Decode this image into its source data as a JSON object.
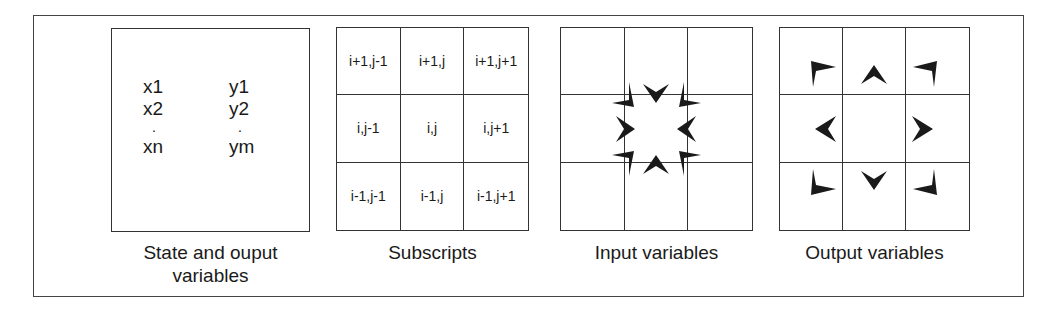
{
  "panels": {
    "state": {
      "caption_line1": "State and ouput",
      "caption_line2": "variables",
      "x_vars": [
        "x1",
        "x2",
        ".",
        "xn"
      ],
      "y_vars": [
        "y1",
        "y2",
        ".",
        "ym"
      ]
    },
    "subscripts": {
      "caption": "Subscripts",
      "cells": [
        [
          "i+1,j-1",
          "i+1,j",
          "i+1,j+1"
        ],
        [
          "i,j-1",
          "i,j",
          "i,j+1"
        ],
        [
          "i-1,j-1",
          "i-1,j",
          "i-1,j+1"
        ]
      ]
    },
    "input": {
      "caption": "Input variables",
      "arrow_direction": "inward",
      "arrows": [
        "top-left",
        "top",
        "top-right",
        "left",
        "right",
        "bottom-left",
        "bottom",
        "bottom-right"
      ]
    },
    "output": {
      "caption": "Output variables",
      "arrow_direction": "outward",
      "arrows": [
        "top-left",
        "top",
        "top-right",
        "left",
        "right",
        "bottom-left",
        "bottom",
        "bottom-right"
      ]
    }
  },
  "colors": {
    "line": "#333333",
    "arrow": "#1a1a1a",
    "background": "#ffffff"
  }
}
